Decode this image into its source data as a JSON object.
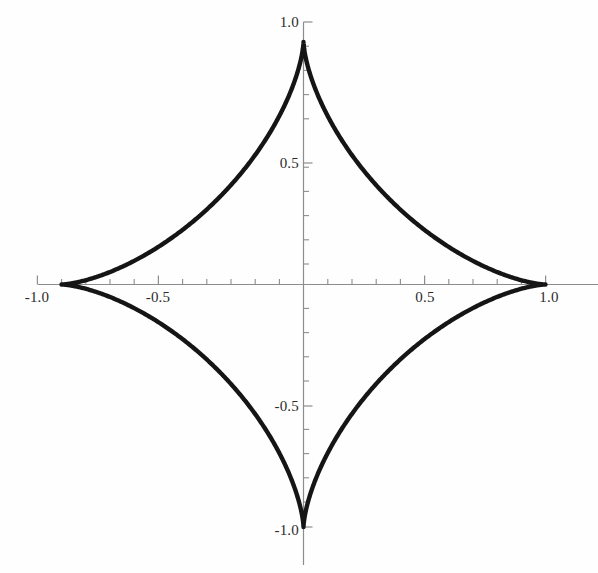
{
  "chart_data": {
    "type": "line",
    "title": "",
    "subtitle": "",
    "xlabel": "",
    "ylabel": "",
    "curve_name": "astroid",
    "equation": "x^(2/3) + y^(2/3) = 1",
    "parametric": {
      "x": "cos(t)^3",
      "y": "sin(t)^3",
      "t_range": [
        0,
        6.283185307179586
      ]
    },
    "xlim": [
      -1.1,
      1.22
    ],
    "ylim": [
      -1.16,
      1.08
    ],
    "grid": false,
    "legend": null,
    "axes_style": "centered-crosshair",
    "line_color": "#151515",
    "line_width": 4.4,
    "axis_color": "#8d8d8d",
    "background_color": "#fefefe",
    "cusps": [
      {
        "label": "right-cusp",
        "x": 1.0,
        "y": 0.0
      },
      {
        "label": "top-cusp",
        "x": 0.0,
        "y": 1.0
      },
      {
        "label": "left-cusp",
        "x": -1.0,
        "y": 0.0
      },
      {
        "label": "bottom-cusp",
        "x": 0.0,
        "y": -1.0
      }
    ],
    "x_axis": {
      "major_ticks": [
        -1.0,
        -0.5,
        0.5,
        1.0
      ],
      "major_tick_labels": [
        "-1.0",
        "-0.5",
        "0.5",
        "1.0"
      ],
      "minor_tick_step": 0.1,
      "minor_ticks": [
        -1.0,
        -0.9,
        -0.8,
        -0.7,
        -0.6,
        -0.5,
        -0.4,
        -0.3,
        -0.2,
        -0.1,
        0.1,
        0.2,
        0.3,
        0.4,
        0.5,
        0.6,
        0.7,
        0.8,
        0.9,
        1.0
      ],
      "range_drawn": [
        -1.09,
        1.22
      ]
    },
    "y_axis": {
      "major_ticks": [
        -1.0,
        -0.5,
        0.5,
        1.0
      ],
      "major_tick_labels": [
        "-1.0",
        "-0.5",
        "0.5",
        "1.0"
      ],
      "minor_tick_step": 0.1,
      "minor_ticks": [
        -1.0,
        -0.9,
        -0.8,
        -0.7,
        -0.6,
        -0.5,
        -0.4,
        -0.3,
        -0.2,
        -0.1,
        0.1,
        0.2,
        0.3,
        0.4,
        0.5,
        0.6,
        0.7,
        0.8,
        0.9,
        1.0
      ],
      "range_drawn": [
        -1.16,
        1.08
      ]
    },
    "data_points": [
      {
        "t": 0.0,
        "x": 1.0,
        "y": 0.0
      },
      {
        "t": 0.3927,
        "x": 0.7864,
        "y": 0.056
      },
      {
        "t": 0.7854,
        "x": 0.3536,
        "y": 0.3536
      },
      {
        "t": 1.1781,
        "x": 0.056,
        "y": 0.7864
      },
      {
        "t": 1.5708,
        "x": 0.0,
        "y": 1.0
      },
      {
        "t": 1.9635,
        "x": -0.056,
        "y": 0.7864
      },
      {
        "t": 2.3562,
        "x": -0.3536,
        "y": 0.3536
      },
      {
        "t": 2.7489,
        "x": -0.7864,
        "y": 0.056
      },
      {
        "t": 3.1416,
        "x": -1.0,
        "y": 0.0
      },
      {
        "t": 3.5343,
        "x": -0.7864,
        "y": -0.056
      },
      {
        "t": 3.927,
        "x": -0.3536,
        "y": -0.3536
      },
      {
        "t": 4.3197,
        "x": -0.056,
        "y": -0.7864
      },
      {
        "t": 4.7124,
        "x": 0.0,
        "y": -1.0
      },
      {
        "t": 5.1051,
        "x": 0.056,
        "y": -0.7864
      },
      {
        "t": 5.4978,
        "x": 0.3536,
        "y": -0.3536
      },
      {
        "t": 5.8905,
        "x": 0.7864,
        "y": -0.056
      },
      {
        "t": 6.2832,
        "x": 1.0,
        "y": 0.0
      }
    ]
  },
  "labels": {
    "x_neg_one": "-1.0",
    "x_neg_half": "-0.5",
    "x_pos_half": "0.5",
    "x_pos_one": "1.0",
    "y_pos_one": "1.0",
    "y_pos_half": "0.5",
    "y_neg_half": "-0.5",
    "y_neg_one": "-1.0"
  }
}
